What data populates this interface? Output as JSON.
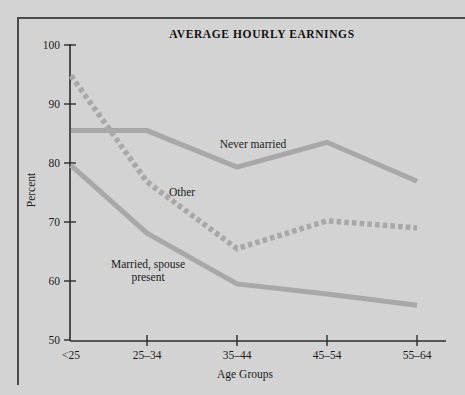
{
  "chart_data": {
    "type": "line",
    "title": "AVERAGE HOURLY EARNINGS",
    "xlabel": "Age Groups",
    "ylabel": "Percent",
    "categories": [
      "<25",
      "25–34",
      "35–44",
      "45–54",
      "55–64"
    ],
    "ylim": [
      50,
      100
    ],
    "yticks": [
      50,
      60,
      70,
      80,
      90,
      100
    ],
    "ytick_labels": [
      "50",
      "60",
      "70",
      "80",
      "90",
      "100"
    ],
    "grid": false,
    "legend_position": "inline-annotations",
    "series": [
      {
        "name": "Never married",
        "style": "solid",
        "color": "#a8a8a8",
        "values": [
          85.5,
          85.5,
          79.3,
          83.5,
          76.9
        ]
      },
      {
        "name": "Other",
        "style": "dotted",
        "color": "#a8a8a8",
        "values": [
          94.8,
          76.8,
          65.5,
          70.2,
          69.0
        ]
      },
      {
        "name": "Married, spouse present",
        "style": "solid",
        "color": "#a8a8a8",
        "values": [
          79.6,
          68.1,
          59.5,
          57.8,
          55.9
        ]
      }
    ],
    "annotations": [
      {
        "id": "never-married",
        "text": "Never married",
        "x": 253,
        "y": 148
      },
      {
        "id": "other",
        "text": "Other",
        "x": 182,
        "y": 196
      },
      {
        "id": "married-line1",
        "text": "Married, spouse",
        "x": 148,
        "y": 268
      },
      {
        "id": "married-line2",
        "text": "present",
        "x": 148,
        "y": 281
      }
    ]
  },
  "axis": {
    "y_label": "Percent",
    "x_label": "Age Groups"
  }
}
